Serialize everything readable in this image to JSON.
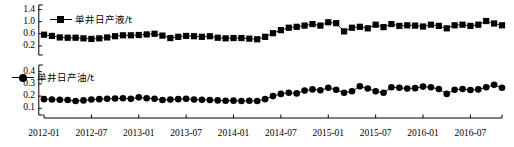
{
  "chart_data": [
    {
      "type": "line",
      "panel": "top",
      "title": "",
      "xlabel": "",
      "ylabel": "",
      "series_name": "单井日产液/t",
      "legend": [
        "单井日产液/t"
      ],
      "legend_position": "top-left-inside",
      "marker": "square",
      "grid": false,
      "ylim": [
        0.0,
        1.45
      ],
      "yticks": [
        "1.4",
        "1.0",
        "0.6",
        "0.2"
      ],
      "ytick_values": [
        1.4,
        1.0,
        0.6,
        0.2
      ],
      "x": [
        "2012-01",
        "2012-02",
        "2012-03",
        "2012-04",
        "2012-05",
        "2012-06",
        "2012-07",
        "2012-08",
        "2012-09",
        "2012-10",
        "2012-11",
        "2012-12",
        "2013-01",
        "2013-02",
        "2013-03",
        "2013-04",
        "2013-05",
        "2013-06",
        "2013-07",
        "2013-08",
        "2013-09",
        "2013-10",
        "2013-11",
        "2013-12",
        "2014-01",
        "2014-02",
        "2014-03",
        "2014-04",
        "2014-05",
        "2014-06",
        "2014-07",
        "2014-08",
        "2014-09",
        "2014-10",
        "2014-11",
        "2014-12",
        "2015-01",
        "2015-02",
        "2015-03",
        "2015-04",
        "2015-05",
        "2015-06",
        "2015-07",
        "2015-08",
        "2015-09",
        "2015-10",
        "2015-11",
        "2015-12",
        "2016-01",
        "2016-02",
        "2016-03",
        "2016-04",
        "2016-05",
        "2016-06",
        "2016-07",
        "2016-08",
        "2016-09",
        "2016-10",
        "2016-11"
      ],
      "values": [
        0.57,
        0.53,
        0.48,
        0.47,
        0.47,
        0.45,
        0.43,
        0.45,
        0.48,
        0.52,
        0.55,
        0.55,
        0.56,
        0.58,
        0.6,
        0.54,
        0.46,
        0.5,
        0.53,
        0.52,
        0.5,
        0.52,
        0.47,
        0.45,
        0.46,
        0.46,
        0.44,
        0.42,
        0.5,
        0.62,
        0.72,
        0.8,
        0.83,
        0.87,
        0.92,
        0.87,
        0.98,
        0.95,
        0.68,
        0.8,
        0.83,
        0.78,
        0.9,
        0.82,
        0.92,
        0.86,
        0.88,
        0.87,
        0.84,
        0.9,
        0.86,
        0.78,
        0.88,
        0.9,
        0.86,
        0.9,
        1.02,
        0.94,
        0.88
      ]
    },
    {
      "type": "line",
      "panel": "bottom",
      "title": "",
      "xlabel": "",
      "ylabel": "",
      "series_name": "单井日产油/t",
      "legend": [
        "单井日产油/t"
      ],
      "legend_position": "top-left-inside",
      "marker": "circle",
      "grid": false,
      "ylim": [
        0.07,
        0.43
      ],
      "yticks": [
        "0.4",
        "0.3",
        "0.2",
        "0.1"
      ],
      "ytick_values": [
        0.4,
        0.3,
        0.2,
        0.1
      ],
      "x": [
        "2012-01",
        "2012-02",
        "2012-03",
        "2012-04",
        "2012-05",
        "2012-06",
        "2012-07",
        "2012-08",
        "2012-09",
        "2012-10",
        "2012-11",
        "2012-12",
        "2013-01",
        "2013-02",
        "2013-03",
        "2013-04",
        "2013-05",
        "2013-06",
        "2013-07",
        "2013-08",
        "2013-09",
        "2013-10",
        "2013-11",
        "2013-12",
        "2014-01",
        "2014-02",
        "2014-03",
        "2014-04",
        "2014-05",
        "2014-06",
        "2014-07",
        "2014-08",
        "2014-09",
        "2014-10",
        "2014-11",
        "2014-12",
        "2015-01",
        "2015-02",
        "2015-03",
        "2015-04",
        "2015-05",
        "2015-06",
        "2015-07",
        "2015-08",
        "2015-09",
        "2015-10",
        "2015-11",
        "2015-12",
        "2016-01",
        "2016-02",
        "2016-03",
        "2016-04",
        "2016-05",
        "2016-06",
        "2016-07",
        "2016-08",
        "2016-09",
        "2016-10",
        "2016-11"
      ],
      "values": [
        0.175,
        0.172,
        0.17,
        0.168,
        0.16,
        0.165,
        0.172,
        0.175,
        0.178,
        0.18,
        0.182,
        0.178,
        0.19,
        0.182,
        0.178,
        0.168,
        0.172,
        0.175,
        0.178,
        0.172,
        0.17,
        0.168,
        0.165,
        0.162,
        0.163,
        0.16,
        0.162,
        0.16,
        0.175,
        0.2,
        0.218,
        0.228,
        0.222,
        0.245,
        0.255,
        0.248,
        0.268,
        0.252,
        0.228,
        0.24,
        0.28,
        0.262,
        0.24,
        0.228,
        0.272,
        0.268,
        0.262,
        0.265,
        0.278,
        0.272,
        0.258,
        0.218,
        0.252,
        0.258,
        0.25,
        0.255,
        0.272,
        0.292,
        0.268
      ]
    }
  ],
  "axis": {
    "xtick_labels": [
      "2012-01",
      "2012-07",
      "2013-01",
      "2013-07",
      "2014-01",
      "2014-07",
      "2015-01",
      "2015-07",
      "2016-01",
      "2016-07"
    ],
    "xtick_indices": [
      0,
      6,
      12,
      18,
      24,
      30,
      36,
      42,
      48,
      54
    ]
  },
  "colors": {
    "series": "#000000",
    "axis": "#000000",
    "background": "#ffffff"
  }
}
